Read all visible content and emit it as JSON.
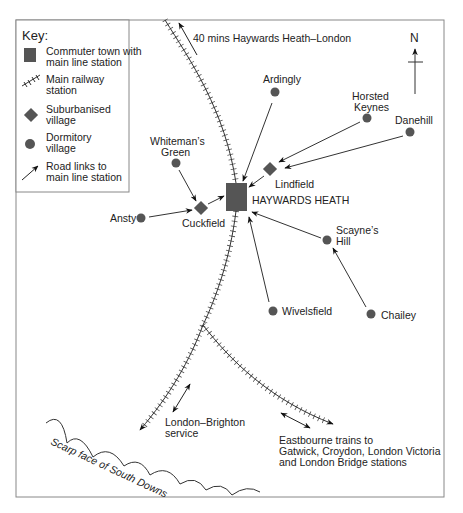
{
  "key": {
    "title": "Key:",
    "items": [
      {
        "symbol": "square",
        "line1": "Commuter town with",
        "line2": "main line station"
      },
      {
        "symbol": "railway-hatch",
        "line1": "Main railway",
        "line2": "station"
      },
      {
        "symbol": "diamond",
        "line1": "Suburbanised",
        "line2": "village"
      },
      {
        "symbol": "dot",
        "line1": "Dormitory",
        "line2": "village"
      },
      {
        "symbol": "arrow",
        "line1": "Road links to",
        "line2": "main line station"
      }
    ]
  },
  "north": {
    "label": "N"
  },
  "london_link": {
    "label": "40 mins Haywards Heath–London"
  },
  "town": {
    "name": "HAYWARDS HEATH",
    "type": "Commuter town with main line station"
  },
  "suburbanised_villages": [
    {
      "name": "Lindfield"
    },
    {
      "name": "Cuckfield"
    }
  ],
  "dormitory_villages": [
    {
      "name": "Ardingly"
    },
    {
      "name_line1": "Horsted",
      "name_line2": "Keynes"
    },
    {
      "name": "Danehill"
    },
    {
      "name_line1": "Whiteman’s",
      "name_line2": "Green"
    },
    {
      "name": "Ansty"
    },
    {
      "name_line1": "Scayne’s",
      "name_line2": "Hill"
    },
    {
      "name": "Wivelsfield"
    },
    {
      "name": "Chailey"
    }
  ],
  "services": {
    "brighton": {
      "line1": "London–Brighton",
      "line2": "service"
    },
    "eastbourne": {
      "line1": "Eastbourne trains to",
      "line2": "Gatwick, Croydon, London Victoria",
      "line3": "and London Bridge stations"
    }
  },
  "scarp": {
    "label": "Scarp face of South Downs"
  },
  "colors": {
    "symbol_fill": "#555555",
    "line": "#333333",
    "border": "#888888"
  }
}
